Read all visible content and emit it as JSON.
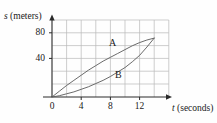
{
  "chart_data": {
    "type": "line",
    "title": "",
    "xlabel": "t (seconds)",
    "ylabel": "s (meters)",
    "xlabel_var": "t",
    "xlabel_unit": "(seconds)",
    "ylabel_var": "s",
    "ylabel_unit": "(meters)",
    "xlim": [
      0,
      16
    ],
    "ylim": [
      0,
      120
    ],
    "xticks": [
      0,
      4,
      8,
      12
    ],
    "xtick_labels": [
      "0",
      "4",
      "8",
      "12"
    ],
    "yticks": [
      40,
      80
    ],
    "ytick_labels": [
      "40",
      "80"
    ],
    "grid": true,
    "grid_x_step": 2,
    "grid_y_step": 20,
    "grid_color": "#b9b9b9",
    "axis_color": "#2a2a2a",
    "curve_color": "#555555",
    "legend": "none",
    "annotations": [
      {
        "text": "A",
        "x": 8.6,
        "y": 72
      },
      {
        "text": "B",
        "x": 9.5,
        "y": 30
      }
    ],
    "series": [
      {
        "name": "A",
        "label": "A",
        "shape": "concave-down",
        "x": [
          0,
          1,
          2,
          3,
          4,
          5,
          6,
          7,
          8,
          9,
          10,
          11,
          12,
          13,
          14
        ],
        "values": [
          0,
          9,
          18,
          26,
          34,
          42,
          49,
          56,
          62,
          68,
          74,
          80,
          85,
          89,
          92
        ]
      },
      {
        "name": "B",
        "label": "B",
        "shape": "concave-up",
        "x": [
          0,
          1,
          2,
          3,
          4,
          5,
          6,
          7,
          8,
          9,
          10,
          11,
          12,
          13,
          14
        ],
        "values": [
          0,
          2,
          5,
          8,
          12,
          16,
          21,
          26,
          32,
          39,
          46,
          55,
          65,
          78,
          92
        ]
      }
    ],
    "intersections": [
      {
        "x": 0,
        "y": 0
      },
      {
        "x": 14,
        "y": 92
      }
    ]
  }
}
